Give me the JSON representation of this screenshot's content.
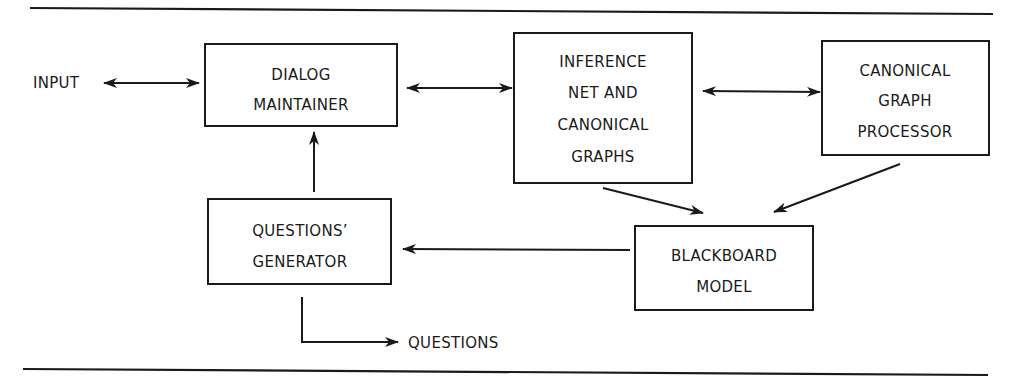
{
  "diagram": {
    "type": "block-diagram",
    "external": {
      "input_label": "INPUT",
      "questions_label": "QUESTIONS"
    },
    "nodes": [
      {
        "id": "dialog",
        "lines": [
          "DIALOG",
          "MAINTAINER"
        ]
      },
      {
        "id": "inference",
        "lines": [
          "INFERENCE",
          "NET AND",
          "CANONICAL",
          "GRAPHS"
        ]
      },
      {
        "id": "cgp",
        "lines": [
          "CANONICAL",
          "GRAPH",
          "PROCESSOR"
        ]
      },
      {
        "id": "qgen",
        "lines": [
          "QUESTIONS’",
          "GENERATOR"
        ]
      },
      {
        "id": "blackboard",
        "lines": [
          "BLACKBOARD",
          "MODEL"
        ]
      }
    ],
    "edges": [
      {
        "from": "INPUT",
        "to": "dialog",
        "direction": "bidirectional"
      },
      {
        "from": "dialog",
        "to": "inference",
        "direction": "bidirectional"
      },
      {
        "from": "inference",
        "to": "cgp",
        "direction": "bidirectional"
      },
      {
        "from": "inference",
        "to": "blackboard",
        "direction": "forward"
      },
      {
        "from": "cgp",
        "to": "blackboard",
        "direction": "forward"
      },
      {
        "from": "blackboard",
        "to": "qgen",
        "direction": "forward"
      },
      {
        "from": "qgen",
        "to": "dialog",
        "direction": "forward"
      },
      {
        "from": "qgen",
        "to": "QUESTIONS",
        "direction": "forward"
      }
    ],
    "colors": {
      "ink": "#1a1a1a",
      "background": "#ffffff"
    }
  }
}
